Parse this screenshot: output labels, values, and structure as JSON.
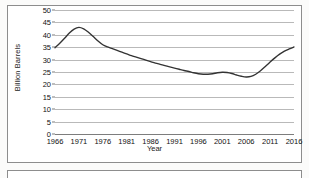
{
  "chart_data": {
    "type": "line",
    "title": "",
    "xlabel": "Year",
    "ylabel": "Billion Barrels",
    "xlim": [
      1966,
      2016
    ],
    "ylim": [
      0,
      50
    ],
    "grid": true,
    "legend": false,
    "line_color": "#333333",
    "gridline_color": "#b9b9b9",
    "ytick_labels": [
      "50",
      "45",
      "40",
      "35",
      "30",
      "25",
      "20",
      "15",
      "10",
      "5",
      "0"
    ],
    "ytick_values": [
      50,
      45,
      40,
      35,
      30,
      25,
      20,
      15,
      10,
      5,
      0
    ],
    "xtick_labels": [
      "1966",
      "1971",
      "1976",
      "1981",
      "1986",
      "1991",
      "1996",
      "2001",
      "2006",
      "2011",
      "2016"
    ],
    "xtick_values": [
      1966,
      1971,
      1976,
      1981,
      1986,
      1991,
      1996,
      2001,
      2006,
      2011,
      2016
    ],
    "x": [
      1966,
      1967,
      1968,
      1969,
      1970,
      1971,
      1972,
      1973,
      1974,
      1975,
      1976,
      1977,
      1978,
      1979,
      1980,
      1981,
      1982,
      1983,
      1984,
      1985,
      1986,
      1987,
      1988,
      1989,
      1990,
      1991,
      1992,
      1993,
      1994,
      1995,
      1996,
      1997,
      1998,
      1999,
      2000,
      2001,
      2002,
      2003,
      2004,
      2005,
      2006,
      2007,
      2008,
      2009,
      2010,
      2011,
      2012,
      2013,
      2014,
      2015,
      2016
    ],
    "values": [
      34.8,
      36.6,
      38.6,
      40.7,
      42.3,
      43.0,
      42.4,
      41.0,
      39.3,
      37.5,
      36.0,
      35.1,
      34.4,
      33.7,
      33.0,
      32.3,
      31.6,
      31.0,
      30.4,
      29.8,
      29.2,
      28.6,
      28.1,
      27.6,
      27.1,
      26.6,
      26.1,
      25.6,
      25.2,
      24.7,
      24.3,
      24.1,
      24.1,
      24.3,
      24.7,
      24.9,
      24.8,
      24.4,
      23.8,
      23.3,
      23.0,
      23.2,
      24.1,
      25.5,
      27.2,
      29.0,
      30.7,
      32.2,
      33.4,
      34.3,
      35.1
    ]
  },
  "axis": {
    "y_title": "Billion Barrels",
    "x_title": "Year"
  }
}
